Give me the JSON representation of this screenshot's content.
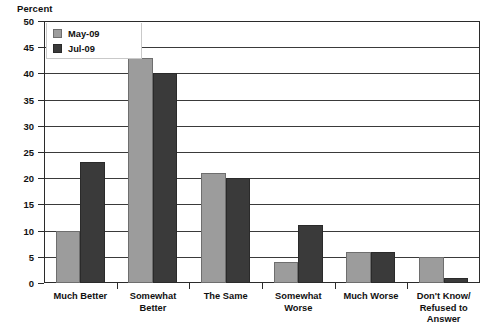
{
  "chart_data": {
    "type": "bar",
    "title": "",
    "subtitle": "",
    "xlabel": "",
    "ylabel": "Percent",
    "ylim": [
      0,
      50
    ],
    "ytick_step": 5,
    "yticks": [
      "0",
      "5",
      "10",
      "15",
      "20",
      "25",
      "30",
      "35",
      "40",
      "45",
      "50"
    ],
    "grid": true,
    "grid_axis": "y",
    "legend_position": "top-left",
    "categories": [
      "Much Better",
      "Somewhat Better",
      "The Same",
      "Somewhat Worse",
      "Much Worse",
      "Don't Know/ Refused to Answer"
    ],
    "category_lines": [
      [
        "Much Better"
      ],
      [
        "Somewhat Better"
      ],
      [
        "The Same"
      ],
      [
        "Somewhat Worse"
      ],
      [
        "Much Worse"
      ],
      [
        "Don't Know/",
        "Refused to Answer"
      ]
    ],
    "series": [
      {
        "name": "May-09",
        "color": "#9c9c9c",
        "values": [
          10,
          43,
          21,
          4,
          6,
          5
        ]
      },
      {
        "name": "Jul-09",
        "color": "#3a3a3a",
        "values": [
          23,
          40,
          20,
          11,
          6,
          1
        ]
      }
    ]
  },
  "legend": {
    "items": [
      {
        "label": "May-09",
        "swatch": "series-1-swatch"
      },
      {
        "label": "Jul-09",
        "swatch": "series-2-swatch"
      }
    ]
  },
  "axis": {
    "y_title": "Percent"
  }
}
